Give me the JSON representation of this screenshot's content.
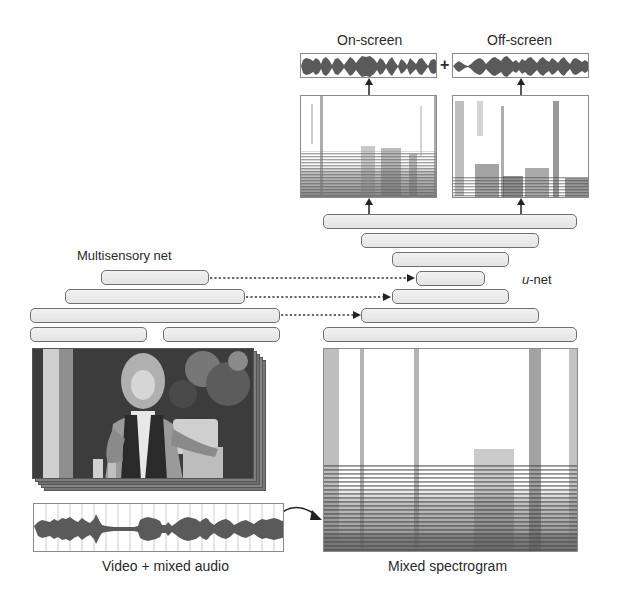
{
  "outputs": {
    "on_screen_label": "On-screen",
    "off_screen_label": "Off-screen",
    "plus_symbol": "+"
  },
  "unet": {
    "label_prefix": "u",
    "label_suffix": "-net",
    "bar_count": 7
  },
  "multisensory": {
    "label": "Multisensory net",
    "bar_count": 5
  },
  "inputs": {
    "video_audio_label": "Video + mixed audio",
    "spectrogram_label": "Mixed spectrogram"
  },
  "colors": {
    "stroke": "#6f6f6f",
    "bar_fill": "#ebebeb",
    "waveform": "#5a5a5a",
    "text": "#2a2a2a"
  }
}
